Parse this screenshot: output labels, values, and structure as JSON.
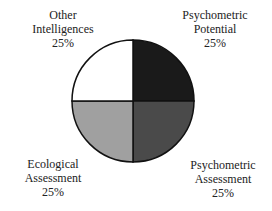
{
  "chart_data": {
    "type": "pie",
    "title": "",
    "categories": [
      "Psychometric Potential",
      "Psychometric Assessment",
      "Ecological Assessment",
      "Other Intelligences"
    ],
    "values": [
      25,
      25,
      25,
      25
    ],
    "unit": "%",
    "colors": [
      "#1a1a1a",
      "#4a4a4a",
      "#a0a0a0",
      "#ffffff"
    ],
    "legend": "none (direct labels)"
  },
  "labels": [
    {
      "line1": "Psychometric",
      "line2": "Potential",
      "pct": "25%"
    },
    {
      "line1": "Psychometric",
      "line2": "Assessment",
      "pct": "25%"
    },
    {
      "line1": "Ecological",
      "line2": "Assessment",
      "pct": "25%"
    },
    {
      "line1": "Other",
      "line2": "Intelligences",
      "pct": "25%"
    }
  ]
}
